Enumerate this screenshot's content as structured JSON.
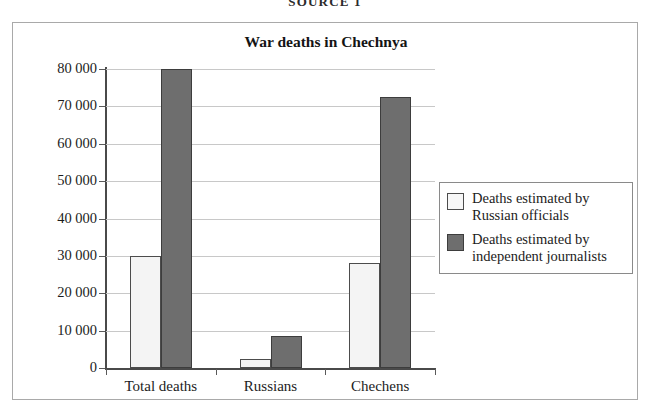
{
  "caption": "SOURCE 1",
  "frame": {
    "border_color": "#a9a9a9"
  },
  "chart_data": {
    "type": "bar",
    "title": "War deaths in Chechnya",
    "xlabel": "",
    "ylabel": "",
    "categories": [
      "Total deaths",
      "Russians",
      "Chechens"
    ],
    "series": [
      {
        "name": "Deaths estimated by Russian officials",
        "color": "#f4f4f4",
        "border_color": "#4c4c4c",
        "values": [
          30000,
          2500,
          28000
        ]
      },
      {
        "name": "Deaths estimated by independent journalists",
        "color": "#6e6e6e",
        "border_color": "#3d3d3d",
        "values": [
          80000,
          8500,
          72500
        ]
      }
    ],
    "ylim": [
      0,
      80000
    ],
    "ytick_values": [
      0,
      10000,
      20000,
      30000,
      40000,
      50000,
      60000,
      70000,
      80000
    ],
    "ytick_labels": [
      "0",
      "10 000",
      "20 000",
      "30 000",
      "40 000",
      "50 000",
      "60 000",
      "70 000",
      "80 000"
    ],
    "grid": true,
    "grid_color": "#c8c8c8",
    "legend_position": "right"
  },
  "legend": {
    "items": [
      {
        "line1": "Deaths estimated by",
        "line2": "Russian officials"
      },
      {
        "line1": "Deaths estimated by",
        "line2": "independent journalists"
      }
    ]
  }
}
